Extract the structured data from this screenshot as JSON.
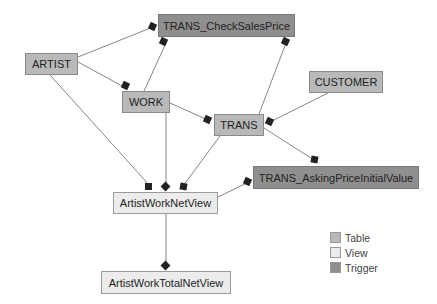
{
  "nodes": {
    "trans_check_sales_price": {
      "label": "TRANS_CheckSalesPrice",
      "type": "trigger"
    },
    "artist": {
      "label": "ARTIST",
      "type": "table"
    },
    "work": {
      "label": "WORK",
      "type": "table"
    },
    "customer": {
      "label": "CUSTOMER",
      "type": "table"
    },
    "trans": {
      "label": "TRANS",
      "type": "table"
    },
    "trans_asking_price_initial_value": {
      "label": "TRANS_AskingPriceInitialValue",
      "type": "trigger"
    },
    "artist_work_net_view": {
      "label": "ArtistWorkNetView",
      "type": "view"
    },
    "artist_work_total_net_view": {
      "label": "ArtistWorkTotalNetView",
      "type": "view"
    }
  },
  "edges": [
    {
      "from": "ARTIST",
      "to": "TRANS_CheckSalesPrice"
    },
    {
      "from": "ARTIST",
      "to": "WORK"
    },
    {
      "from": "ARTIST",
      "to": "ArtistWorkNetView"
    },
    {
      "from": "WORK",
      "to": "TRANS_CheckSalesPrice"
    },
    {
      "from": "WORK",
      "to": "TRANS"
    },
    {
      "from": "WORK",
      "to": "ArtistWorkNetView"
    },
    {
      "from": "TRANS",
      "to": "TRANS_CheckSalesPrice"
    },
    {
      "from": "CUSTOMER",
      "to": "TRANS"
    },
    {
      "from": "TRANS",
      "to": "TRANS_AskingPriceInitialValue"
    },
    {
      "from": "TRANS",
      "to": "ArtistWorkNetView"
    },
    {
      "from": "ArtistWorkNetView",
      "to": "TRANS_AskingPriceInitialValue"
    },
    {
      "from": "ArtistWorkNetView",
      "to": "ArtistWorkTotalNetView"
    }
  ],
  "legend": {
    "table": {
      "label": "Table",
      "color": "#b9b9b9"
    },
    "view": {
      "label": "View",
      "color": "#ececec"
    },
    "trigger": {
      "label": "Trigger",
      "color": "#8f8f8f"
    }
  }
}
